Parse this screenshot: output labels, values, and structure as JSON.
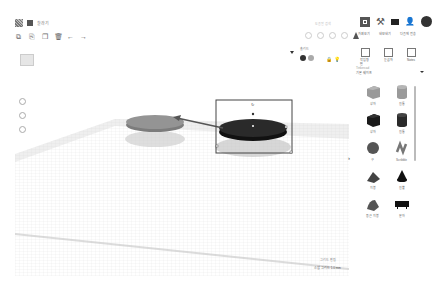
{
  "app": {
    "document_title": "찰라기",
    "search_placeholder": "도움말 검색"
  },
  "toolbar": {
    "icons": [
      "copy-icon",
      "paste-icon",
      "duplicate-icon",
      "delete-icon",
      "undo-icon",
      "redo-icon"
    ]
  },
  "top_right": {
    "modes": [
      {
        "label": "가져오기"
      },
      {
        "label": "내보내기"
      },
      {
        "label": "다음에 전송"
      }
    ],
    "icons": [
      "grid-view-icon",
      "hammer-icon",
      "briefcase-icon",
      "add-user-icon",
      "avatar"
    ]
  },
  "view_tools": [
    "light-icon",
    "rotate-icon",
    "align-icon",
    "mirror-icon",
    "tree-icon"
  ],
  "color_panel": {
    "label": "솔리드",
    "solid_color": "#333333",
    "hole_color": "#aaaaaa"
  },
  "right_panel": {
    "icons": [
      {
        "label": "작업평면"
      },
      {
        "label": "눈금자"
      },
      {
        "label": "Notes"
      }
    ],
    "category_label": "Tinkercad",
    "category_value": "기본 쉐이프",
    "shapes": [
      {
        "label": "상자",
        "kind": "box-hole",
        "color": "#9a9a9a"
      },
      {
        "label": "원통",
        "kind": "cylinder-hole",
        "color": "#9a9a9a"
      },
      {
        "label": "상자",
        "kind": "box",
        "color": "#1a1a1a"
      },
      {
        "label": "원통",
        "kind": "cylinder",
        "color": "#2a2a2a"
      },
      {
        "label": "구",
        "kind": "sphere",
        "color": "#555555"
      },
      {
        "label": "Scribble",
        "kind": "scribble",
        "color": "#777777"
      },
      {
        "label": "지붕",
        "kind": "roof",
        "color": "#444444"
      },
      {
        "label": "원뿔",
        "kind": "cone",
        "color": "#111111"
      },
      {
        "label": "둥근 지붕",
        "kind": "round-roof",
        "color": "#555555"
      },
      {
        "label": "문자",
        "kind": "text",
        "color": "#111111"
      }
    ]
  },
  "scene": {
    "objects": [
      {
        "name": "hole-disc",
        "color": "#8c8c8c"
      },
      {
        "name": "solid-disc",
        "color": "#222222",
        "selected": true
      }
    ]
  },
  "status": {
    "grid_settings": "그리드 편집",
    "snap_label": "스냅 그리드",
    "snap_value": "1.0 mm"
  }
}
